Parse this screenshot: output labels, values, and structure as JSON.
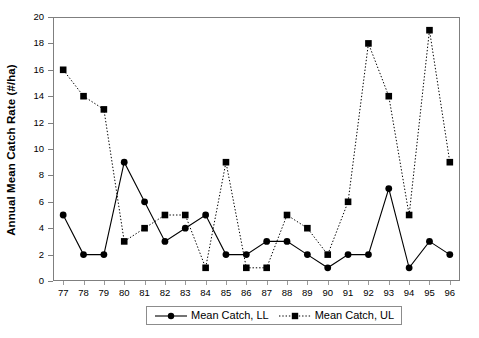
{
  "chart_data": {
    "type": "line",
    "title": "",
    "xlabel": "",
    "ylabel": "Annual Mean Catch Rate (#/ha)",
    "categories": [
      "77",
      "78",
      "79",
      "80",
      "81",
      "82",
      "83",
      "84",
      "85",
      "86",
      "87",
      "88",
      "89",
      "90",
      "91",
      "92",
      "93",
      "94",
      "95",
      "96"
    ],
    "x_tick_labels": [
      "77",
      "78",
      "79",
      "80",
      "81",
      "82",
      "83",
      "84",
      "85",
      "86",
      "87",
      "88",
      "89",
      "90",
      "91",
      "92",
      "93",
      "94",
      "95",
      "96"
    ],
    "y_tick_labels": [
      "0",
      "2",
      "4",
      "6",
      "8",
      "10",
      "12",
      "14",
      "16",
      "18",
      "20"
    ],
    "y_ticks": [
      0,
      2,
      4,
      6,
      8,
      10,
      12,
      14,
      16,
      18,
      20
    ],
    "ylim": [
      0,
      20
    ],
    "grid": false,
    "legend_position": "bottom-center",
    "series": [
      {
        "name": "Mean Catch, LL",
        "marker": "circle",
        "line_style": "solid",
        "color": "#000000",
        "values": [
          5,
          2,
          2,
          9,
          6,
          3,
          4,
          5,
          2,
          2,
          3,
          3,
          2,
          1,
          2,
          2,
          7,
          1,
          3,
          2
        ]
      },
      {
        "name": "Mean Catch, UL",
        "marker": "square",
        "line_style": "dotted",
        "color": "#000000",
        "values": [
          16,
          14,
          13,
          3,
          4,
          5,
          5,
          1,
          9,
          1,
          1,
          5,
          4,
          2,
          6,
          18,
          14,
          5,
          19,
          9
        ]
      }
    ]
  },
  "legend": {
    "items": [
      {
        "label": "Mean Catch, LL",
        "marker": "circle",
        "line_style": "solid"
      },
      {
        "label": "Mean Catch, UL",
        "marker": "square",
        "line_style": "dotted"
      }
    ]
  },
  "axes": {
    "y_title": "Annual Mean Catch Rate (#/ha)"
  }
}
